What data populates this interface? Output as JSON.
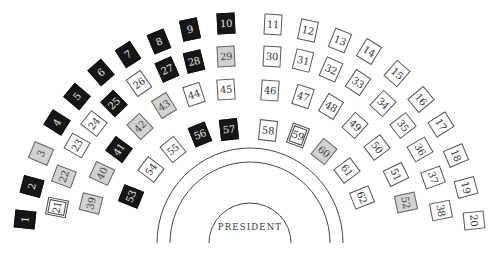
{
  "diagram": {
    "center_label": "PRESIDENT",
    "colors": {
      "black": "#161616",
      "gray": "#d2d2d2",
      "white": "#ffffff",
      "line": "#444444"
    },
    "seats": [
      {
        "n": "1",
        "x": 25,
        "y": 219,
        "r": -84,
        "type": "black"
      },
      {
        "n": "2",
        "x": 32,
        "y": 186,
        "r": -75,
        "type": "black"
      },
      {
        "n": "3",
        "x": 41,
        "y": 153,
        "r": -67,
        "type": "gray"
      },
      {
        "n": "4",
        "x": 57,
        "y": 122,
        "r": -58,
        "type": "black"
      },
      {
        "n": "5",
        "x": 77,
        "y": 96,
        "r": -50,
        "type": "black"
      },
      {
        "n": "6",
        "x": 101,
        "y": 72,
        "r": -41,
        "type": "black"
      },
      {
        "n": "7",
        "x": 128,
        "y": 54,
        "r": -33,
        "type": "black"
      },
      {
        "n": "8",
        "x": 159,
        "y": 41,
        "r": -22,
        "type": "black"
      },
      {
        "n": "9",
        "x": 190,
        "y": 29,
        "r": -12,
        "type": "black"
      },
      {
        "n": "10",
        "x": 226,
        "y": 23,
        "r": -3,
        "type": "black"
      },
      {
        "n": "11",
        "x": 273,
        "y": 24,
        "r": 3,
        "type": "white"
      },
      {
        "n": "12",
        "x": 308,
        "y": 30,
        "r": 12,
        "type": "white"
      },
      {
        "n": "13",
        "x": 340,
        "y": 40,
        "r": 22,
        "type": "white"
      },
      {
        "n": "14",
        "x": 369,
        "y": 51,
        "r": 32,
        "type": "white"
      },
      {
        "n": "15",
        "x": 397,
        "y": 73,
        "r": 41,
        "type": "white"
      },
      {
        "n": "16",
        "x": 421,
        "y": 99,
        "r": 50,
        "type": "white"
      },
      {
        "n": "17",
        "x": 441,
        "y": 124,
        "r": 58,
        "type": "white"
      },
      {
        "n": "18",
        "x": 456,
        "y": 155,
        "r": 67,
        "type": "white"
      },
      {
        "n": "19",
        "x": 466,
        "y": 187,
        "r": 75,
        "type": "white"
      },
      {
        "n": "20",
        "x": 474,
        "y": 220,
        "r": 84,
        "type": "white"
      },
      {
        "n": "21",
        "x": 57,
        "y": 207,
        "r": -79,
        "type": "double"
      },
      {
        "n": "22",
        "x": 64,
        "y": 176,
        "r": -70,
        "type": "gray"
      },
      {
        "n": "23",
        "x": 77,
        "y": 145,
        "r": -60,
        "type": "white"
      },
      {
        "n": "24",
        "x": 94,
        "y": 123,
        "r": -52,
        "type": "white"
      },
      {
        "n": "25",
        "x": 114,
        "y": 103,
        "r": -44,
        "type": "black"
      },
      {
        "n": "26",
        "x": 139,
        "y": 83,
        "r": -35,
        "type": "white"
      },
      {
        "n": "27",
        "x": 167,
        "y": 69,
        "r": -24,
        "type": "black"
      },
      {
        "n": "28",
        "x": 194,
        "y": 61,
        "r": -14,
        "type": "black"
      },
      {
        "n": "29",
        "x": 226,
        "y": 56,
        "r": -3,
        "type": "gray"
      },
      {
        "n": "30",
        "x": 272,
        "y": 56,
        "r": 3,
        "type": "white"
      },
      {
        "n": "31",
        "x": 303,
        "y": 60,
        "r": 14,
        "type": "white"
      },
      {
        "n": "32",
        "x": 331,
        "y": 69,
        "r": 24,
        "type": "white"
      },
      {
        "n": "33",
        "x": 358,
        "y": 82,
        "r": 34,
        "type": "white"
      },
      {
        "n": "34",
        "x": 383,
        "y": 103,
        "r": 43,
        "type": "white"
      },
      {
        "n": "35",
        "x": 403,
        "y": 125,
        "r": 52,
        "type": "white"
      },
      {
        "n": "36",
        "x": 420,
        "y": 149,
        "r": 60,
        "type": "white"
      },
      {
        "n": "37",
        "x": 433,
        "y": 177,
        "r": 70,
        "type": "white"
      },
      {
        "n": "38",
        "x": 441,
        "y": 210,
        "r": 79,
        "type": "white"
      },
      {
        "n": "39",
        "x": 91,
        "y": 203,
        "r": -76,
        "type": "gray"
      },
      {
        "n": "40",
        "x": 102,
        "y": 173,
        "r": -65,
        "type": "gray"
      },
      {
        "n": "41",
        "x": 119,
        "y": 149,
        "r": -54,
        "type": "black"
      },
      {
        "n": "42",
        "x": 140,
        "y": 126,
        "r": -43,
        "type": "gray"
      },
      {
        "n": "43",
        "x": 164,
        "y": 105,
        "r": -32,
        "type": "gray"
      },
      {
        "n": "44",
        "x": 194,
        "y": 94,
        "r": -18,
        "type": "white"
      },
      {
        "n": "45",
        "x": 226,
        "y": 89,
        "r": -4,
        "type": "white"
      },
      {
        "n": "46",
        "x": 270,
        "y": 90,
        "r": 4,
        "type": "white"
      },
      {
        "n": "47",
        "x": 303,
        "y": 96,
        "r": 18,
        "type": "white"
      },
      {
        "n": "48",
        "x": 331,
        "y": 106,
        "r": 31,
        "type": "white"
      },
      {
        "n": "49",
        "x": 355,
        "y": 125,
        "r": 42,
        "type": "white"
      },
      {
        "n": "50",
        "x": 377,
        "y": 147,
        "r": 53,
        "type": "white"
      },
      {
        "n": "51",
        "x": 396,
        "y": 174,
        "r": 64,
        "type": "white"
      },
      {
        "n": "52",
        "x": 406,
        "y": 202,
        "r": 78,
        "type": "gray"
      },
      {
        "n": "53",
        "x": 131,
        "y": 196,
        "r": -68,
        "type": "black"
      },
      {
        "n": "54",
        "x": 151,
        "y": 169,
        "r": -53,
        "type": "white"
      },
      {
        "n": "55",
        "x": 173,
        "y": 149,
        "r": -39,
        "type": "white"
      },
      {
        "n": "56",
        "x": 200,
        "y": 134,
        "r": -22,
        "type": "black"
      },
      {
        "n": "57",
        "x": 229,
        "y": 129,
        "r": -6,
        "type": "black"
      },
      {
        "n": "58",
        "x": 268,
        "y": 130,
        "r": 6,
        "type": "white"
      },
      {
        "n": "59",
        "x": 298,
        "y": 135,
        "r": 20,
        "type": "double"
      },
      {
        "n": "60",
        "x": 324,
        "y": 151,
        "r": 39,
        "type": "gray"
      },
      {
        "n": "61",
        "x": 347,
        "y": 170,
        "r": 53,
        "type": "white"
      },
      {
        "n": "62",
        "x": 362,
        "y": 197,
        "r": 68,
        "type": "white"
      }
    ]
  }
}
